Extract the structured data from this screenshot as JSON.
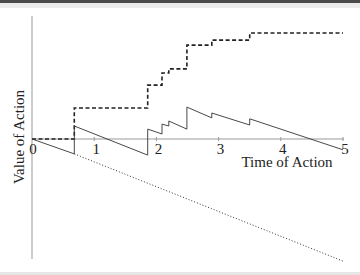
{
  "chart_data": {
    "type": "line",
    "title": "",
    "xlabel": "Time of Action",
    "ylabel": "Value of Action",
    "xlim": [
      0,
      5
    ],
    "ylim": [
      -4,
      4
    ],
    "grid": false,
    "legend": null,
    "x_ticks": [
      "0",
      "1",
      "2",
      "3",
      "4",
      "5"
    ],
    "series": [
      {
        "name": "dashed-step",
        "style": "dashed",
        "points": [
          [
            0,
            0
          ],
          [
            0.68,
            0
          ],
          [
            0.68,
            1.0
          ],
          [
            1.86,
            1.0
          ],
          [
            1.86,
            1.74
          ],
          [
            2.09,
            1.74
          ],
          [
            2.09,
            2.13
          ],
          [
            2.2,
            2.13
          ],
          [
            2.2,
            2.26
          ],
          [
            2.49,
            2.26
          ],
          [
            2.49,
            3.03
          ],
          [
            2.89,
            3.03
          ],
          [
            2.89,
            3.19
          ],
          [
            3.5,
            3.19
          ],
          [
            3.5,
            3.42
          ],
          [
            5,
            3.42
          ]
        ]
      },
      {
        "name": "solid-sawtooth",
        "style": "solid",
        "points": [
          [
            0,
            0
          ],
          [
            0.68,
            -0.48
          ],
          [
            0.68,
            0.42
          ],
          [
            1.86,
            -0.52
          ],
          [
            1.86,
            0.32
          ],
          [
            2.09,
            0.16
          ],
          [
            2.09,
            0.48
          ],
          [
            2.2,
            0.42
          ],
          [
            2.2,
            0.58
          ],
          [
            2.49,
            0.32
          ],
          [
            2.49,
            1.03
          ],
          [
            2.89,
            0.68
          ],
          [
            2.89,
            0.84
          ],
          [
            3.5,
            0.45
          ],
          [
            3.5,
            0.65
          ],
          [
            5,
            -0.35
          ]
        ]
      },
      {
        "name": "dotted-decline",
        "style": "dotted",
        "points": [
          [
            0.68,
            -0.48
          ],
          [
            5,
            -3.94
          ]
        ]
      }
    ]
  },
  "labels": {
    "x_axis_title": "Time of Action",
    "y_axis_title": "Value of Action",
    "ticks": [
      "0",
      "1",
      "2",
      "3",
      "4",
      "5"
    ]
  }
}
